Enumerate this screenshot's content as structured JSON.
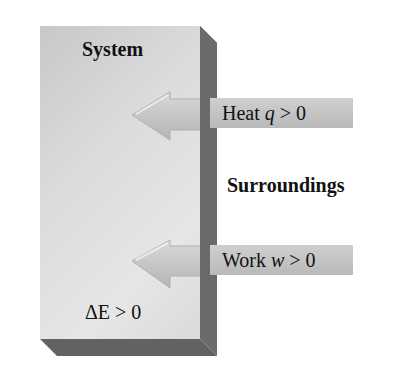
{
  "diagram": {
    "system": {
      "label": "System",
      "energy_change": {
        "symbol": "ΔE",
        "relation": " > 0"
      }
    },
    "surroundings": {
      "label": "Surroundings"
    },
    "arrows": [
      {
        "name": "heat",
        "label_text": "Heat ",
        "variable": "q",
        "relation": " > 0",
        "direction": "into-system"
      },
      {
        "name": "work",
        "label_text": "Work ",
        "variable": "w",
        "relation": " > 0",
        "direction": "into-system"
      }
    ],
    "colors": {
      "box_face": "#dcdcdc",
      "box_shadow": "#6e6e6e",
      "arrow_fill": "#c4c4c4",
      "arrow_highlight": "#e0e0e0",
      "tag_fill": "#c4c4c4",
      "text": "#111111"
    }
  }
}
